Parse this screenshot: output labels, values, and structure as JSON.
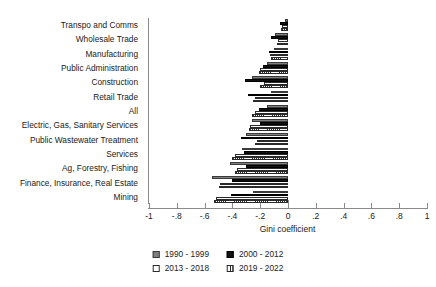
{
  "chart_data": {
    "type": "bar",
    "orientation": "horizontal",
    "title": "",
    "xlabel": "Gini coefficient",
    "ylabel": "",
    "xlim": [
      -1,
      1
    ],
    "xticks": [
      -1,
      -0.8,
      -0.6,
      -0.4,
      -0.2,
      0,
      0.2,
      0.4,
      0.6,
      0.8,
      1
    ],
    "xticklabels": [
      "-1",
      "-.8",
      "-.6",
      "-.4",
      "-.2",
      "0",
      ".2",
      ".4",
      ".6",
      ".8",
      "1"
    ],
    "grid": false,
    "legend_position": "bottom-center",
    "categories": [
      "Transpo and Comms",
      "Wholesale Trade",
      "Manufacturing",
      "Public Administration",
      "Construction",
      "Retail Trade",
      "All",
      "Electric, Gas, Sanitary Services",
      "Public Wastewater Treatment",
      "Services",
      "Ag, Forestry, Fishing",
      "Finance, Insurance, Real Estate",
      "Mining"
    ],
    "series": [
      {
        "name": "1990 - 1999",
        "color": "#808080",
        "values": [
          -0.02,
          -0.09,
          -0.1,
          -0.15,
          -0.26,
          -0.12,
          -0.15,
          -0.26,
          -0.3,
          -0.33,
          -0.42,
          -0.55,
          -0.25
        ]
      },
      {
        "name": "2000 - 2012",
        "color": "#111111",
        "values": [
          -0.06,
          -0.12,
          -0.14,
          -0.18,
          -0.31,
          -0.29,
          -0.21,
          -0.2,
          -0.34,
          -0.32,
          -0.3,
          -0.4,
          -0.41
        ]
      },
      {
        "name": "2013 - 2018",
        "color": "#ffffff",
        "values": [
          -0.04,
          -0.07,
          -0.13,
          -0.2,
          -0.17,
          -0.24,
          -0.24,
          -0.27,
          -0.22,
          -0.38,
          -0.37,
          -0.49,
          -0.52
        ]
      },
      {
        "name": "2019 - 2022",
        "color": "hatched",
        "values": [
          -0.05,
          -0.08,
          -0.12,
          -0.21,
          -0.2,
          -0.25,
          -0.26,
          -0.28,
          -0.24,
          -0.4,
          -0.38,
          -0.5,
          -0.53
        ]
      }
    ]
  },
  "axis": {
    "x_title": "Gini coefficient"
  },
  "legend": {
    "items": [
      {
        "label": "1990 - 1999",
        "series": 0
      },
      {
        "label": "2000 - 2012",
        "series": 1
      },
      {
        "label": "2013 - 2018",
        "series": 2
      },
      {
        "label": "2019 - 2022",
        "series": 3
      }
    ]
  }
}
